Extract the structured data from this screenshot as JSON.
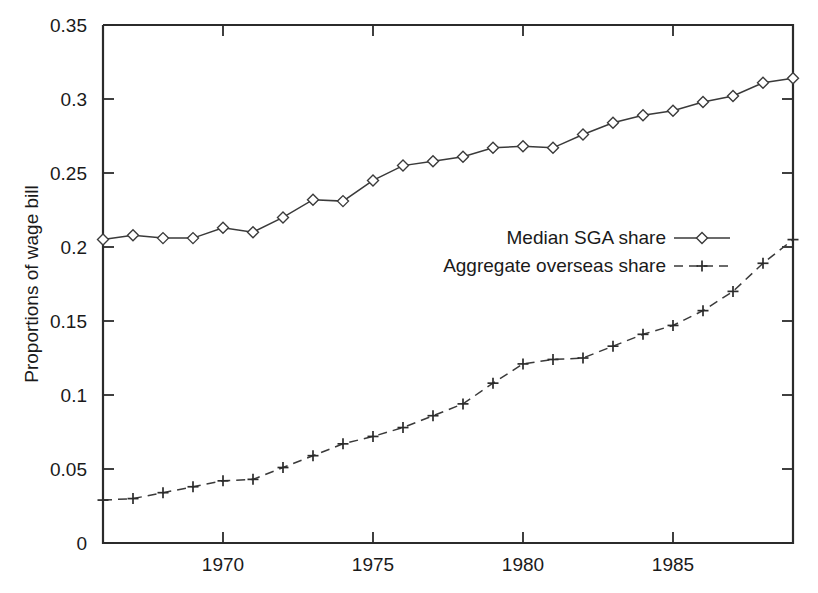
{
  "chart_data": {
    "type": "line",
    "title": "",
    "xlabel": "",
    "ylabel": "Proportions of wage bill",
    "xlim": [
      1966,
      1989
    ],
    "ylim": [
      0,
      0.35
    ],
    "grid": false,
    "legend_position": "center-right",
    "x": [
      1966,
      1967,
      1968,
      1969,
      1970,
      1971,
      1972,
      1973,
      1974,
      1975,
      1976,
      1977,
      1978,
      1979,
      1980,
      1981,
      1982,
      1983,
      1984,
      1985,
      1986,
      1987,
      1988,
      1989
    ],
    "xtick_labels": [
      "1970",
      "1975",
      "1980",
      "1985"
    ],
    "xtick_values": [
      1970,
      1975,
      1980,
      1985
    ],
    "ytick_labels": [
      "0",
      "0.05",
      "0.1",
      "0.15",
      "0.2",
      "0.25",
      "0.3",
      "0.35"
    ],
    "ytick_values": [
      0,
      0.05,
      0.1,
      0.15,
      0.2,
      0.25,
      0.3,
      0.35
    ],
    "series": [
      {
        "name": "Median SGA share",
        "marker": "diamond",
        "linestyle": "solid",
        "color": "#3a3a3a",
        "values": [
          0.205,
          0.208,
          0.206,
          0.206,
          0.213,
          0.21,
          0.22,
          0.232,
          0.231,
          0.245,
          0.255,
          0.258,
          0.261,
          0.267,
          0.268,
          0.267,
          0.276,
          0.284,
          0.289,
          0.292,
          0.298,
          0.302,
          0.311,
          0.314
        ]
      },
      {
        "name": "Aggregate overseas share",
        "marker": "plus",
        "linestyle": "dashed",
        "color": "#3a3a3a",
        "values": [
          0.029,
          0.03,
          0.034,
          0.038,
          0.042,
          0.043,
          0.051,
          0.059,
          0.067,
          0.072,
          0.078,
          0.086,
          0.094,
          0.108,
          0.121,
          0.124,
          0.125,
          0.133,
          0.141,
          0.147,
          0.157,
          0.17,
          0.189,
          0.205
        ]
      }
    ]
  },
  "legend": {
    "entries": [
      {
        "label": "Median SGA share"
      },
      {
        "label": "Aggregate overseas share"
      }
    ]
  }
}
